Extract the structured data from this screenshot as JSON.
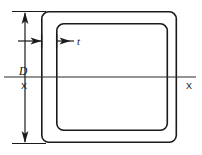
{
  "figure": {
    "background_color": "#ffffff",
    "line_color": "#1a1a1a",
    "axis_line_color": "#2b2b2b",
    "width": 202,
    "height": 155
  },
  "labels": {
    "depth_label": "D",
    "thickness_label": "t",
    "axis_label_left": "X",
    "axis_label_right": "X"
  },
  "geometry": {
    "outer_rect": {
      "x": 41,
      "y": 11,
      "width": 136,
      "height": 132,
      "corner_radius": 7,
      "stroke_width": 1.6
    },
    "inner_rect": {
      "x": 56,
      "y": 23,
      "width": 112,
      "height": 108,
      "corner_radius": 7,
      "stroke_width": 1.6
    },
    "neutral_axis": {
      "y": 77,
      "x_start": 4,
      "x_end": 196,
      "stroke_width": 1.1
    },
    "depth_dimension": {
      "x": 25,
      "y_top": 11,
      "y_bottom": 143,
      "extension_top_y": 11,
      "extension_bottom_y": 143,
      "extension_x_start": 12,
      "extension_x_end": 44,
      "stroke_width": 1.2
    },
    "thickness_dimension": {
      "y": 41,
      "lead_x_start": 18,
      "outer_wall_x": 41,
      "inner_wall_x": 56,
      "label_x": 78,
      "stroke_width": 1.2
    }
  }
}
